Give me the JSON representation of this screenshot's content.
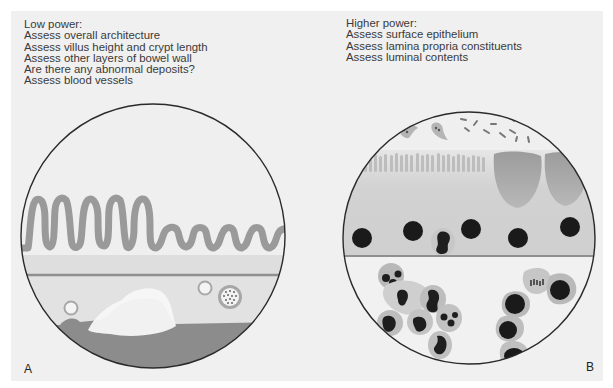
{
  "figure": {
    "background_color": "#f0f0f0",
    "panels": [
      {
        "id": "A",
        "label": "A",
        "title": "Low power:",
        "items": [
          "Assess overall architecture",
          "Assess villus height and crypt length",
          "Assess other layers of bowel wall",
          "Are there any abnormal deposits?",
          "Assess blood vessels"
        ],
        "illustration": "low-power-bowel-wall-view"
      },
      {
        "id": "B",
        "label": "B",
        "title": "Higher power:",
        "items": [
          "Assess surface epithelium",
          "Assess lamina propria constituents",
          "Assess luminal contents"
        ],
        "illustration": "high-power-mucosa-view"
      }
    ],
    "colors": {
      "outline": "#2a2a2a",
      "villus": "#9a9a9a",
      "mucosa": "#dcdcdc",
      "submucosa_line": "#8f8f8f",
      "muscle_layer": "#8a8a8a",
      "nucleus": "#1a1a1a",
      "cell_cytoplasm": "#b5b5b5",
      "goblet_cell": "#a0a0a0"
    }
  }
}
